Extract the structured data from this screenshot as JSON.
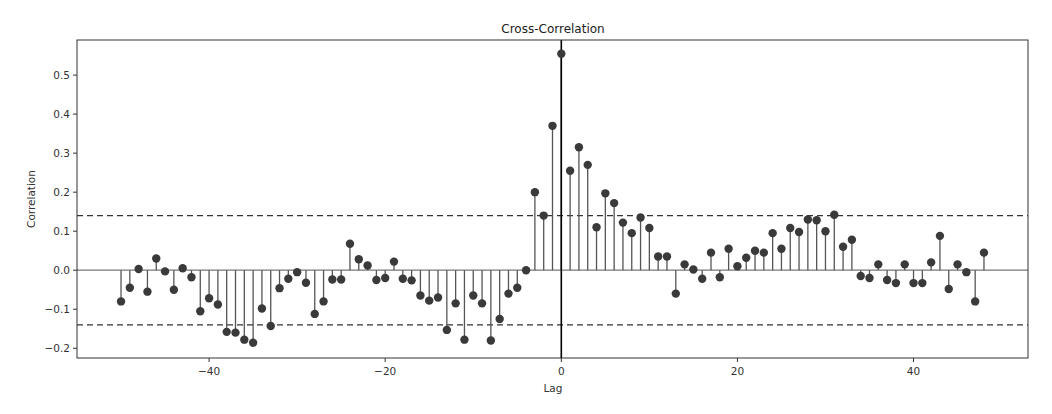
{
  "chart_data": {
    "type": "stem",
    "title": "Cross-Correlation",
    "xlabel": "Lag",
    "ylabel": "Correlation",
    "xlim": [
      -55,
      53
    ],
    "ylim": [
      -0.225,
      0.59
    ],
    "xticks": [
      -40,
      -20,
      0,
      20,
      40
    ],
    "xtick_labels": [
      "−40",
      "−20",
      "0",
      "20",
      "40"
    ],
    "yticks": [
      -0.2,
      -0.1,
      0.0,
      0.1,
      0.2,
      0.3,
      0.4,
      0.5
    ],
    "ytick_labels": [
      "−0.2",
      "−0.1",
      "0.0",
      "0.1",
      "0.2",
      "0.3",
      "0.4",
      "0.5"
    ],
    "grid": false,
    "confidence_bounds": [
      0.14,
      -0.14
    ],
    "zero_lag_marker": 0,
    "x": [
      -50,
      -49,
      -48,
      -47,
      -46,
      -45,
      -44,
      -43,
      -42,
      -41,
      -40,
      -39,
      -38,
      -37,
      -36,
      -35,
      -34,
      -33,
      -32,
      -31,
      -30,
      -29,
      -28,
      -27,
      -26,
      -25,
      -24,
      -23,
      -22,
      -21,
      -20,
      -19,
      -18,
      -17,
      -16,
      -15,
      -14,
      -13,
      -12,
      -11,
      -10,
      -9,
      -8,
      -7,
      -6,
      -5,
      -4,
      -3,
      -2,
      -1,
      0,
      1,
      2,
      3,
      4,
      5,
      6,
      7,
      8,
      9,
      10,
      11,
      12,
      13,
      14,
      15,
      16,
      17,
      18,
      19,
      20,
      21,
      22,
      23,
      24,
      25,
      26,
      27,
      28,
      29,
      30,
      31,
      32,
      33,
      34,
      35,
      36,
      37,
      38,
      39,
      40,
      41,
      42,
      43,
      44,
      45,
      46,
      47,
      48
    ],
    "values": [
      -0.08,
      -0.045,
      0.003,
      -0.055,
      0.03,
      -0.003,
      -0.05,
      0.005,
      -0.018,
      -0.105,
      -0.072,
      -0.088,
      -0.158,
      -0.16,
      -0.178,
      -0.186,
      -0.098,
      -0.143,
      -0.046,
      -0.022,
      -0.005,
      -0.032,
      -0.112,
      -0.08,
      -0.024,
      -0.024,
      0.068,
      0.028,
      0.012,
      -0.025,
      -0.02,
      0.022,
      -0.022,
      -0.026,
      -0.065,
      -0.078,
      -0.07,
      -0.153,
      -0.085,
      -0.178,
      -0.065,
      -0.085,
      -0.18,
      -0.125,
      -0.06,
      -0.045,
      0.0,
      0.2,
      0.14,
      0.37,
      0.555,
      0.255,
      0.315,
      0.27,
      0.11,
      0.197,
      0.172,
      0.122,
      0.095,
      0.135,
      0.108,
      0.035,
      0.035,
      -0.06,
      0.015,
      0.002,
      -0.022,
      0.045,
      -0.018,
      0.055,
      0.01,
      0.032,
      0.05,
      0.045,
      0.095,
      0.055,
      0.108,
      0.098,
      0.13,
      0.128,
      0.1,
      0.142,
      0.06,
      0.078,
      -0.015,
      -0.02,
      0.015,
      -0.025,
      -0.033,
      0.015,
      -0.033,
      -0.033,
      0.02,
      0.088,
      -0.048,
      0.015,
      -0.005,
      -0.08,
      0.045
    ],
    "colors": {
      "marker": "#3a3a3a",
      "stem": "#555555",
      "baseline": "#777777",
      "confidence": "#333333",
      "zero_line": "#000000",
      "frame": "#333333"
    }
  }
}
